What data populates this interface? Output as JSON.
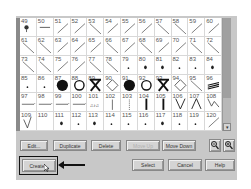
{
  "grid": {
    "rows": [
      [
        {
          "n": "49",
          "s": "pin"
        },
        {
          "n": "50",
          "s": "hline"
        },
        {
          "n": "51",
          "s": "slash"
        },
        {
          "n": "52",
          "s": "slash"
        },
        {
          "n": "53",
          "s": "backslash"
        },
        {
          "n": "54",
          "s": "slash"
        },
        {
          "n": "55",
          "s": "slash"
        },
        {
          "n": "56",
          "s": "slash"
        },
        {
          "n": "57",
          "s": "backslash"
        },
        {
          "n": "58",
          "s": "backslash"
        },
        {
          "n": "59",
          "s": "slash"
        },
        {
          "n": "60",
          "s": "slash"
        }
      ],
      [
        {
          "n": "61",
          "s": "backslash"
        },
        {
          "n": "62",
          "s": "backslash"
        },
        {
          "n": "63",
          "s": "slash"
        },
        {
          "n": "64",
          "s": "slash"
        },
        {
          "n": "65",
          "s": "slash"
        },
        {
          "n": "66",
          "s": "backslash"
        },
        {
          "n": "67",
          "s": "slash"
        },
        {
          "n": "68",
          "s": "backslash"
        },
        {
          "n": "69",
          "s": "slash"
        },
        {
          "n": "70",
          "s": "slash"
        },
        {
          "n": "71",
          "s": "backslash"
        },
        {
          "n": "72",
          "s": "backslash"
        }
      ],
      [
        {
          "n": "73",
          "s": "backslash"
        },
        {
          "n": "74",
          "s": "backslash"
        },
        {
          "n": "75",
          "s": "slash"
        },
        {
          "n": "76",
          "s": "slash"
        },
        {
          "n": "77",
          "s": "backslash"
        },
        {
          "n": "78",
          "s": "backslash"
        },
        {
          "n": "79",
          "s": "dot"
        },
        {
          "n": "80",
          "s": "blob"
        },
        {
          "n": "81",
          "s": "blob"
        },
        {
          "n": "82",
          "s": "dot"
        },
        {
          "n": "83",
          "s": "dot"
        },
        {
          "n": "84",
          "s": "blob"
        }
      ],
      [
        {
          "n": "85",
          "s": "dot"
        },
        {
          "n": "86",
          "s": "dot"
        },
        {
          "n": "87",
          "s": "filled-circle"
        },
        {
          "n": "88",
          "s": "circle"
        },
        {
          "n": "89",
          "s": "hourglass-x"
        },
        {
          "n": "90",
          "s": "diamond"
        },
        {
          "n": "91",
          "s": "filled-circle"
        },
        {
          "n": "92",
          "s": "circle"
        },
        {
          "n": "93",
          "s": "hourglass-x"
        },
        {
          "n": "94",
          "s": "diamond"
        },
        {
          "n": "95",
          "s": "backslash"
        },
        {
          "n": "96",
          "s": "stripes"
        }
      ],
      [
        {
          "n": "97",
          "s": "underline"
        },
        {
          "n": "98",
          "s": "underline"
        },
        {
          "n": "99",
          "s": "underline"
        },
        {
          "n": "100",
          "s": "underline"
        },
        {
          "n": "101",
          "s": "text"
        },
        {
          "n": "102",
          "s": "vline"
        },
        {
          "n": "103",
          "s": "dotted-vline"
        },
        {
          "n": "104",
          "s": "bold-vline"
        },
        {
          "n": "105",
          "s": "bold-vline"
        },
        {
          "n": "106",
          "s": "v"
        },
        {
          "n": "107",
          "s": "caret"
        },
        {
          "n": "108",
          "s": "zigzag"
        }
      ],
      [
        {
          "n": "109",
          "s": "check"
        },
        {
          "n": "110",
          "s": "none"
        },
        {
          "n": "111",
          "s": "blob"
        },
        {
          "n": "112",
          "s": "dot"
        },
        {
          "n": "113",
          "s": "blob"
        },
        {
          "n": "114",
          "s": "dot"
        },
        {
          "n": "115",
          "s": "dot"
        },
        {
          "n": "116",
          "s": "dot"
        },
        {
          "n": "117",
          "s": "blob"
        },
        {
          "n": "118",
          "s": "dot"
        },
        {
          "n": "119",
          "s": "dot"
        },
        {
          "n": "120",
          "s": "slash"
        }
      ]
    ]
  },
  "buttons": {
    "edit": "Edit...",
    "duplicate": "Duplicate",
    "delete": "Delete",
    "move_up": "Move Up",
    "move_down": "Move Down",
    "create": "Create...",
    "select": "Select",
    "cancel": "Cancel",
    "help": "Help"
  },
  "scrollbar": {
    "down_glyph": "▾"
  },
  "icons": {
    "zoom_out": "zoom-out-icon",
    "zoom_in": "zoom-in-icon"
  }
}
